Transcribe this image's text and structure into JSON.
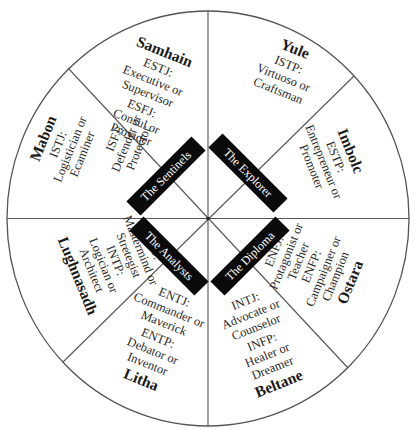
{
  "diagram": {
    "type": "wheel",
    "sectors": 8,
    "colors": {
      "line": "#555555",
      "tag_background": "#0a0a0a",
      "tag_text": "#ffffff",
      "text": "#2a2a2a"
    },
    "groups": [
      {
        "id": "sentinels",
        "label": "The Sentinels"
      },
      {
        "id": "explorer",
        "label": "The Explorer"
      },
      {
        "id": "analysts",
        "label": "The Analysts"
      },
      {
        "id": "diploma",
        "label": "The Diploma"
      }
    ],
    "sections": [
      {
        "id": "samhain",
        "season": "Samhain",
        "group": "sentinels",
        "lines": [
          "ESTJ:",
          "Executive or",
          "Supervisor",
          "ESFJ:",
          "Consul or",
          "Provider"
        ]
      },
      {
        "id": "mabon",
        "season": "Mabon",
        "group": "sentinels",
        "lines": [
          "ISTJ:",
          "Logistician or",
          "Ecaminer",
          "ISFJ:",
          "Defender or",
          "Protector"
        ]
      },
      {
        "id": "yule",
        "season": "Yule",
        "group": "explorer",
        "lines": [
          "ISTP:",
          "Virtuoso or",
          "Craftsman"
        ]
      },
      {
        "id": "imbolc",
        "season": "Imbolc",
        "group": "explorer",
        "lines": [
          "ESTP:",
          "Entrepreneur or",
          "Promoter"
        ]
      },
      {
        "id": "lughnasadh",
        "season": "Lughnasadh",
        "group": "analysts",
        "lines": [
          "INTJ:",
          "Mastermind or",
          "Stretegist",
          "INTP:",
          "Logician or",
          "Architect"
        ]
      },
      {
        "id": "litha",
        "season": "Litha",
        "group": "analysts",
        "lines": [
          "ENTJ:",
          "Commander or",
          "Maverick",
          "ENTP:",
          "Debator or",
          "Inventor"
        ]
      },
      {
        "id": "beltane",
        "season": "Beltane",
        "group": "diploma",
        "lines": [
          "INTJ:",
          "Advocate or",
          "Counselor",
          "INFP:",
          "Healer or",
          "Dreamer"
        ]
      },
      {
        "id": "ostara",
        "season": "Ostara",
        "group": "diploma",
        "lines": [
          "ENFJ:",
          "Protagonist or",
          "Teacher",
          "ENFP:",
          "Campaigner or",
          "Champion"
        ]
      }
    ]
  }
}
